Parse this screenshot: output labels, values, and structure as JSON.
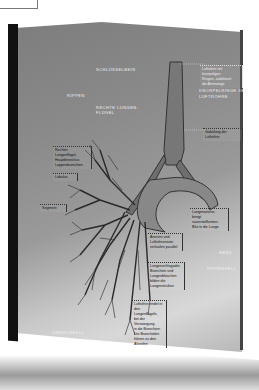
{
  "scene": {
    "description": "Photo of an open book page with an anatomical illustration of the trachea, bronchial tree and lungs",
    "colors": {
      "page": "#8a8a8a",
      "spine": "#111111",
      "background": "#ffffff",
      "airway": "#6e6e6e"
    }
  },
  "labels": {
    "schlusselbein": "SCHLÜSSELBEIN",
    "rippen": "RIPPEN",
    "rechte_lunge": "RECHTE LUNGEN-",
    "rechte_lunge2": "FLÜGEL",
    "knorpel": "KNORPELRINGE DER",
    "knorpel2": "LUFTRÖHRE",
    "zwerchfell": "ZWERCHFELL",
    "herz": "HERZ",
    "rippenfell": "RIPPENFELL"
  },
  "notes": {
    "top_right": [
      "Luftröhre mit knorpeligen",
      "Ringen, stabilisiert",
      "die Atemwege"
    ],
    "gabelung": "Gabelung der Luftröhre",
    "left1": [
      "Rechter Lungenflügel,",
      "Hauptbronchus",
      "Lappenbronchien"
    ],
    "left2": "Lobulus",
    "left3": "Segment",
    "right1": [
      "Lungenarterie,",
      "bringt sauerstoffarmes",
      "Blut in die Lunge"
    ],
    "center1": [
      "Arterien und",
      "Luftröhrenäste",
      "verlaufen parallel"
    ],
    "center2": [
      "Lungenschlagader,",
      "Bronchien und",
      "Lungenbläschen",
      "bilden die",
      "Lungenstruktur"
    ],
    "center3": [
      "Luftröhre endet in",
      "den Lungenflügeln,",
      "bei der Verzweigung",
      "in die Bronchien.",
      "Die Bronchiolen",
      "führen zu den",
      "Alveolen"
    ]
  }
}
